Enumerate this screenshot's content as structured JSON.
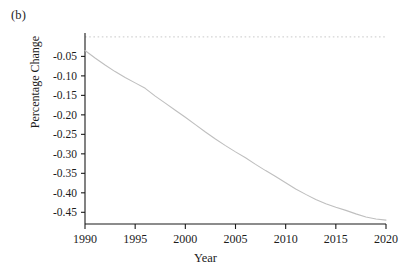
{
  "panel": {
    "label": "(b)"
  },
  "chart_data": {
    "type": "line",
    "title": "",
    "subtitle": "",
    "panel_label": "(b)",
    "xlabel": "Year",
    "ylabel": "Percentage Change",
    "xlim": [
      1990,
      2020
    ],
    "ylim": [
      -0.48,
      0.01
    ],
    "grid": false,
    "legend": null,
    "legend_position": "none",
    "xticks": [
      1990,
      1995,
      2000,
      2005,
      2010,
      2015,
      2020
    ],
    "xtick_labels": [
      "1990",
      "1995",
      "2000",
      "2005",
      "2010",
      "2015",
      "2020"
    ],
    "yticks": [
      -0.05,
      -0.1,
      -0.15,
      -0.2,
      -0.25,
      -0.3,
      -0.35,
      -0.4,
      -0.45
    ],
    "ytick_labels": [
      "-0.05",
      "-0.10",
      "-0.15",
      "-0.20",
      "-0.25",
      "-0.30",
      "-0.35",
      "-0.40",
      "-0.45"
    ],
    "line_color": "#bfbfbf",
    "axis_color": "#1a1a1a",
    "reference_line": {
      "value": 0,
      "style": "dotted",
      "color": "#c9c9c9",
      "orientation": "horizontal"
    },
    "x": [
      1990,
      1991,
      1992,
      1993,
      1994,
      1995,
      1996,
      1997,
      1998,
      1999,
      2000,
      2001,
      2002,
      2003,
      2004,
      2005,
      2006,
      2007,
      2008,
      2009,
      2010,
      2011,
      2012,
      2013,
      2014,
      2015,
      2016,
      2017,
      2018,
      2019,
      2020
    ],
    "series": [
      {
        "name": "Percentage Change",
        "values": [
          -0.035,
          -0.054,
          -0.072,
          -0.089,
          -0.104,
          -0.118,
          -0.132,
          -0.152,
          -0.17,
          -0.188,
          -0.206,
          -0.225,
          -0.244,
          -0.262,
          -0.279,
          -0.295,
          -0.31,
          -0.327,
          -0.343,
          -0.358,
          -0.374,
          -0.39,
          -0.404,
          -0.417,
          -0.428,
          -0.437,
          -0.445,
          -0.454,
          -0.462,
          -0.467,
          -0.47
        ]
      }
    ]
  }
}
